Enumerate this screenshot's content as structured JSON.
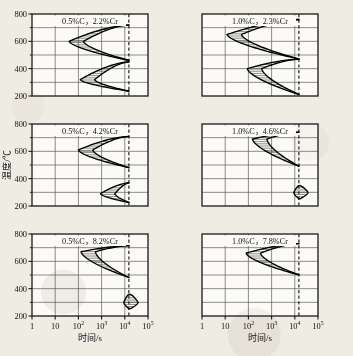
{
  "figure": {
    "x_axis_label": "时间/s",
    "y_axis_label": "温度/℃",
    "x_ticks": [
      "1",
      "10",
      "10",
      "10",
      "10",
      "10"
    ],
    "x_tick_exponents": [
      "",
      "",
      "2",
      "3",
      "4",
      "5"
    ],
    "y_ticks": [
      "800",
      "600",
      "400",
      "200"
    ],
    "y_minor_ticks": [
      "700",
      "500",
      "300"
    ]
  },
  "chart_data": {
    "type": "line",
    "title": "",
    "xlabel": "时间/s",
    "ylabel": "温度/℃",
    "xscale": "log",
    "xlim": [
      1,
      100000
    ],
    "ylim": [
      200,
      800
    ],
    "grid": true,
    "legend": "none",
    "panels": [
      {
        "id": "p1",
        "row": 0,
        "col": 0,
        "annotation": "0.5%C，2.2%Cr",
        "carbon_pct": 0.5,
        "chromium_pct": 2.2,
        "dashed_line_time_s": 15000,
        "noses": [
          {
            "name": "pearlite",
            "nose_time_s": 40,
            "nose_temp_c": 600,
            "upper_temp_c": 720,
            "lower_temp_c": 460
          },
          {
            "name": "bainite",
            "nose_time_s": 120,
            "nose_temp_c": 320,
            "upper_temp_c": 450,
            "lower_temp_c": 235
          }
        ]
      },
      {
        "id": "p2",
        "row": 0,
        "col": 1,
        "annotation": "1.0%C，2.3%Cr",
        "carbon_pct": 1.0,
        "chromium_pct": 2.3,
        "dashed_line_time_s": 15000,
        "noses": [
          {
            "name": "pearlite",
            "nose_time_s": 12,
            "nose_temp_c": 650,
            "upper_temp_c": 760,
            "lower_temp_c": 470
          },
          {
            "name": "bainite",
            "nose_time_s": 90,
            "nose_temp_c": 400,
            "upper_temp_c": 470,
            "lower_temp_c": 210
          }
        ]
      },
      {
        "id": "p3",
        "row": 1,
        "col": 0,
        "annotation": "0.5%C，4.2%Cr",
        "carbon_pct": 0.5,
        "chromium_pct": 4.2,
        "dashed_line_time_s": 15000,
        "noses": [
          {
            "name": "pearlite",
            "nose_time_s": 100,
            "nose_temp_c": 610,
            "upper_temp_c": 710,
            "lower_temp_c": 480
          },
          {
            "name": "bainite",
            "nose_time_s": 900,
            "nose_temp_c": 290,
            "upper_temp_c": 370,
            "lower_temp_c": 225
          }
        ]
      },
      {
        "id": "p4",
        "row": 1,
        "col": 1,
        "annotation": "1.0%C，4.6%Cr",
        "carbon_pct": 1.0,
        "chromium_pct": 4.6,
        "dashed_line_time_s": 15000,
        "noses": [
          {
            "name": "pearlite",
            "nose_time_s": 150,
            "nose_temp_c": 690,
            "upper_temp_c": 740,
            "lower_temp_c": 490
          },
          {
            "name": "bainite",
            "nose_time_s": 9000,
            "nose_temp_c": 300,
            "upper_temp_c": 350,
            "lower_temp_c": 250
          }
        ]
      },
      {
        "id": "p5",
        "row": 2,
        "col": 0,
        "annotation": "0.5%C，8.2%Cr",
        "carbon_pct": 0.5,
        "chromium_pct": 8.2,
        "dashed_line_time_s": 15000,
        "noses": [
          {
            "name": "pearlite",
            "nose_time_s": 130,
            "nose_temp_c": 670,
            "upper_temp_c": 715,
            "lower_temp_c": 480
          },
          {
            "name": "bainite",
            "nose_time_s": 9000,
            "nose_temp_c": 300,
            "upper_temp_c": 360,
            "lower_temp_c": 250
          }
        ]
      },
      {
        "id": "p6",
        "row": 2,
        "col": 1,
        "annotation": "1.0%C，7.8%Cr",
        "carbon_pct": 1.0,
        "chromium_pct": 7.8,
        "dashed_line_time_s": 15000,
        "noses": [
          {
            "name": "pearlite",
            "nose_time_s": 80,
            "nose_temp_c": 660,
            "upper_temp_c": 730,
            "lower_temp_c": 500
          }
        ]
      }
    ]
  }
}
